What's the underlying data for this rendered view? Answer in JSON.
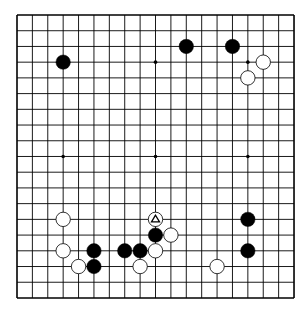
{
  "board": {
    "size": 19,
    "origin_x": 17,
    "origin_y": 15,
    "spacing_x": 15.39,
    "spacing_y": 15.72,
    "stone_radius": 7.2,
    "colors": {
      "background": "#ffffff",
      "line": "#000000",
      "black_stone": "#000000",
      "white_stone": "#ffffff",
      "white_stone_edge": "#000000",
      "marker": "#000000"
    },
    "star_points": [
      [
        3,
        3
      ],
      [
        9,
        3
      ],
      [
        15,
        3
      ],
      [
        3,
        9
      ],
      [
        9,
        9
      ],
      [
        15,
        9
      ],
      [
        3,
        15
      ],
      [
        9,
        15
      ],
      [
        15,
        15
      ]
    ],
    "stones": [
      {
        "color": "black",
        "col": 3,
        "row": 3
      },
      {
        "color": "black",
        "col": 11,
        "row": 2
      },
      {
        "color": "black",
        "col": 14,
        "row": 2
      },
      {
        "color": "white",
        "col": 16,
        "row": 3
      },
      {
        "color": "white",
        "col": 15,
        "row": 4
      },
      {
        "color": "white",
        "col": 3,
        "row": 13
      },
      {
        "color": "white",
        "col": 3,
        "row": 15
      },
      {
        "color": "black",
        "col": 5,
        "row": 15
      },
      {
        "color": "white",
        "col": 4,
        "row": 16
      },
      {
        "color": "black",
        "col": 5,
        "row": 16
      },
      {
        "color": "black",
        "col": 7,
        "row": 15
      },
      {
        "color": "black",
        "col": 8,
        "row": 15
      },
      {
        "color": "white",
        "col": 8,
        "row": 16
      },
      {
        "color": "white",
        "col": 9,
        "row": 13,
        "marker": "triangle"
      },
      {
        "color": "black",
        "col": 9,
        "row": 14
      },
      {
        "color": "white",
        "col": 10,
        "row": 14
      },
      {
        "color": "white",
        "col": 9,
        "row": 15
      },
      {
        "color": "black",
        "col": 15,
        "row": 13
      },
      {
        "color": "black",
        "col": 15,
        "row": 15
      },
      {
        "color": "white",
        "col": 13,
        "row": 16
      }
    ],
    "last_move": {
      "col": 9,
      "row": 13,
      "marker": "triangle-icon"
    }
  }
}
